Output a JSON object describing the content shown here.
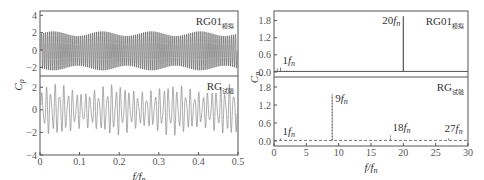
{
  "chart_data": [
    {
      "type": "line",
      "panel": "left",
      "xlabel": "f/f_n",
      "ylabel": "C_p",
      "xlim": [
        0,
        0.5
      ],
      "x_ticks": [
        "0",
        "0.1",
        "0.2",
        "0.3",
        "0.4",
        "0.5"
      ],
      "subplots": [
        {
          "name": "RG01 模拟",
          "label_main": "RG01",
          "label_sub": "模拟",
          "ylim": [
            -3,
            4.5
          ],
          "y_ticks": [
            "4",
            "2",
            "0",
            "-2"
          ],
          "description": "Dense sinusoidal oscillation, amplitude ~±2.3, slowly modulated envelope",
          "amplitude": 2.3,
          "cycles": 100
        },
        {
          "name": "RG 试验",
          "label_main": "RG",
          "label_sub": "试验",
          "ylim": [
            -4,
            3
          ],
          "y_ticks": [
            "2",
            "0",
            "-2",
            "-4"
          ],
          "description": "Irregular oscillation, amplitude ~±2.5, about 45 cycles",
          "amplitude": 2.3,
          "cycles": 45
        }
      ]
    },
    {
      "type": "line",
      "panel": "right",
      "xlabel": "f/f_n",
      "ylabel": "C_p",
      "xlim": [
        0,
        30
      ],
      "x_ticks": [
        "0",
        "5",
        "10",
        "15",
        "20",
        "25",
        "30"
      ],
      "subplots": [
        {
          "name": "RG01 模拟",
          "label_main": "RG01",
          "label_sub": "模拟",
          "ylim": [
            0,
            2.1
          ],
          "y_ticks": [
            "1.8",
            "1.2",
            "0.6",
            "0.0"
          ],
          "peaks": [
            {
              "x": 0.5,
              "y": 0.12
            },
            {
              "x": 1,
              "y": 0.15,
              "label": "1f_n"
            },
            {
              "x": 2,
              "y": 0.05
            },
            {
              "x": 20,
              "y": 1.95,
              "label": "20f_n"
            }
          ],
          "line_style": "solid"
        },
        {
          "name": "RG 试验",
          "label_main": "RG",
          "label_sub": "试验",
          "ylim": [
            0,
            2.1
          ],
          "y_ticks": [
            "1.8",
            "1.2",
            "0.6",
            "0.0"
          ],
          "peaks": [
            {
              "x": 1,
              "y": 0.08,
              "label": "1f_n"
            },
            {
              "x": 9,
              "y": 1.55,
              "label": "9f_n"
            },
            {
              "x": 18,
              "y": 0.2,
              "label": "18f_n"
            },
            {
              "x": 27,
              "y": 0.12,
              "label": "27f_n"
            }
          ],
          "line_style": "dashed"
        }
      ]
    }
  ],
  "labels": {
    "ylabel_main": "C",
    "ylabel_sub": "p",
    "xlabel_f": "f",
    "xlabel_slash": "/",
    "xlabel_fn": "f",
    "xlabel_n": "n"
  },
  "colors": {
    "frame": "#555555",
    "trace": "#555555",
    "trace_light": "#888888"
  }
}
